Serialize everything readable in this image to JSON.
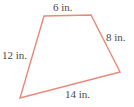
{
  "figure": {
    "name": "quadrilateral-side-lengths",
    "shape_type": "quadrilateral",
    "background_color": "#ffffff",
    "outline_color": "#e8897a",
    "outline_width": 1.4,
    "label_color": "#4a4a4a",
    "unit": "in.",
    "vertices": [
      {
        "name": "top-left",
        "x": 44,
        "y": 16
      },
      {
        "name": "top-right",
        "x": 91,
        "y": 15
      },
      {
        "name": "right",
        "x": 120,
        "y": 72
      },
      {
        "name": "bottom-left",
        "x": 20,
        "y": 98
      }
    ],
    "polygon_points": "44,16 91,15 120,72 20,98",
    "sides": [
      {
        "name": "top-side",
        "label": "6 in.",
        "value": 6,
        "position": "top"
      },
      {
        "name": "right-side",
        "label": "8 in.",
        "value": 8,
        "position": "right"
      },
      {
        "name": "bottom-side",
        "label": "14 in.",
        "value": 14,
        "position": "bottom"
      },
      {
        "name": "left-side",
        "label": "12 in.",
        "value": 12,
        "position": "left"
      }
    ]
  }
}
